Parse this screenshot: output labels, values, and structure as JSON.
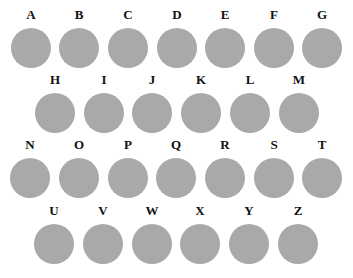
{
  "swatches": {
    "color": "#a9a9a9",
    "rows": [
      {
        "y": 8,
        "items": [
          {
            "label": "A",
            "x": 11
          },
          {
            "label": "B",
            "x": 59
          },
          {
            "label": "C",
            "x": 108
          },
          {
            "label": "D",
            "x": 157
          },
          {
            "label": "E",
            "x": 205
          },
          {
            "label": "F",
            "x": 254
          },
          {
            "label": "G",
            "x": 302
          }
        ]
      },
      {
        "y": 73,
        "items": [
          {
            "label": "H",
            "x": 35
          },
          {
            "label": "I",
            "x": 84
          },
          {
            "label": "J",
            "x": 132
          },
          {
            "label": "K",
            "x": 181
          },
          {
            "label": "L",
            "x": 230
          },
          {
            "label": "M",
            "x": 279
          }
        ]
      },
      {
        "y": 138,
        "items": [
          {
            "label": "N",
            "x": 10
          },
          {
            "label": "O",
            "x": 59
          },
          {
            "label": "P",
            "x": 108
          },
          {
            "label": "Q",
            "x": 156
          },
          {
            "label": "R",
            "x": 205
          },
          {
            "label": "S",
            "x": 254
          },
          {
            "label": "T",
            "x": 302
          }
        ]
      },
      {
        "y": 204,
        "items": [
          {
            "label": "U",
            "x": 34
          },
          {
            "label": "V",
            "x": 83
          },
          {
            "label": "W",
            "x": 132
          },
          {
            "label": "X",
            "x": 180
          },
          {
            "label": "Y",
            "x": 229
          },
          {
            "label": "Z",
            "x": 278
          }
        ]
      }
    ]
  }
}
